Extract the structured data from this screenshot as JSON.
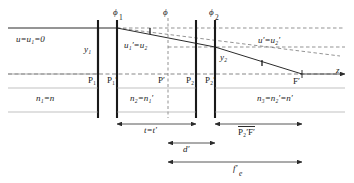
{
  "figure": {
    "type": "optical-ray-diagram",
    "background": "#ffffff",
    "line_color": "#2b2b2b",
    "dash_color": "#555555"
  },
  "axis": {
    "name": "optical-axis",
    "label": "z",
    "y": 74,
    "x_start": 8,
    "x_end": 345,
    "arrow": "right"
  },
  "surfaces": [
    {
      "name": "P1",
      "label_html": "P<sub>1</sub>",
      "label": "P1",
      "x": 98,
      "phi": null
    },
    {
      "name": "P1p",
      "label_html": "P<sub>1</sub>&prime;",
      "label": "P1'",
      "x": 117,
      "phi": "phi1"
    },
    {
      "name": "P2",
      "label_html": "P<sub>2</sub>",
      "label": "P2",
      "x": 196,
      "phi": null
    },
    {
      "name": "P2p",
      "label_html": "P<sub>2</sub>&prime;",
      "label": "P2'",
      "x": 215,
      "phi": "phi2"
    }
  ],
  "principal_plane_dashed": {
    "name": "P-prime-plane",
    "label_html": "P&prime;",
    "label": "P'",
    "x": 168
  },
  "powers": [
    {
      "name": "phi1",
      "label": "ϕ",
      "sub": "1",
      "x": 113,
      "y": 12
    },
    {
      "name": "phi",
      "label": "ϕ",
      "sub": "",
      "x": 163,
      "y": 12
    },
    {
      "name": "phi2",
      "label": "ϕ",
      "sub": "2",
      "x": 211,
      "y": 12
    }
  ],
  "labels": {
    "incoming_angle": {
      "text": "u=u",
      "sub": "1",
      "tail": "=0",
      "x": 18,
      "y": 41
    },
    "mid_angle": {
      "text": "u",
      "x": 128,
      "y": 46
    },
    "outgoing_angle": {
      "text": "u",
      "x": 262,
      "y": 42
    },
    "y1": {
      "text": "y",
      "sub": "1",
      "x": 85,
      "y": 50
    },
    "y2": {
      "text": "y",
      "sub": "2",
      "x": 222,
      "y": 58
    },
    "F_prime": {
      "text": "F′",
      "x": 295,
      "y": 79
    },
    "n1": {
      "text": "n",
      "x": 40,
      "y": 99
    },
    "n2": {
      "text": "n",
      "x": 133,
      "y": 99
    },
    "n3": {
      "text": "n",
      "x": 260,
      "y": 99
    }
  },
  "label_text": {
    "u_in": "u=u₁=0",
    "u_mid": "u₁′=u₂",
    "u_out": "u′=u₂′",
    "y1": "y₁",
    "y2": "y₂",
    "n1": "n₁=n",
    "n2": "n₂=n₁′",
    "n3": "n₃=n₂′=n′",
    "F_prime": "F′",
    "P1": "P₁",
    "P1p": "P₁′",
    "P2": "P₂",
    "P2p": "P₂′",
    "Pp": "P′",
    "axis": "z"
  },
  "dimensions": [
    {
      "name": "t-equals-t-prime",
      "label": "t=t′",
      "x_start": 117,
      "x_end": 196,
      "y_line": 124,
      "label_x": 148,
      "label_y": 128,
      "arrows": "both"
    },
    {
      "name": "P2p-F-prime",
      "label": "P₂′F′",
      "overline": true,
      "x_start": 215,
      "x_end": 302,
      "y_line": 124,
      "label_x": 244,
      "label_y": 128,
      "arrows": "both"
    },
    {
      "name": "d-prime",
      "label": "d′",
      "x_start": 168,
      "x_end": 215,
      "y_line": 143,
      "label_x": 186,
      "label_y": 147,
      "arrows": "both"
    },
    {
      "name": "f-prime-e",
      "label": "f′",
      "sub": "e",
      "x_start": 168,
      "x_end": 302,
      "y_line": 162,
      "label_x": 237,
      "label_y": 166,
      "arrows": "right"
    }
  ],
  "rays": {
    "incoming_solid": {
      "name": "incoming-parallel-ray",
      "x1": 8,
      "y1": 28,
      "x2": 117,
      "y2": 28
    },
    "middle_solid": {
      "name": "ray-between-elements",
      "x1": 117,
      "y1": 28,
      "x2": 215,
      "y2": 47
    },
    "outgoing_solid": {
      "name": "outgoing-ray-to-focus",
      "x1": 215,
      "y1": 47,
      "x2": 302,
      "y2": 74
    },
    "extension_dashed": {
      "name": "back-extension-to-principal-plane",
      "x1": 117,
      "y1": 28,
      "x2": 330,
      "y2": 55
    },
    "horizontal_dashed_top": {
      "name": "dashed-horizontal-at-ray-height",
      "x1": 117,
      "y1": 28,
      "x2": 345,
      "y2": 28
    },
    "horizontal_dashed_mid": {
      "name": "dashed-horizontal-at-y2",
      "x1": 168,
      "y1": 47,
      "x2": 345,
      "y2": 47
    }
  },
  "angle_marks": [
    {
      "name": "angle-u-prime-1",
      "x": 150,
      "y": 34
    },
    {
      "name": "angle-u-prime",
      "x": 262,
      "y": 58
    }
  ]
}
